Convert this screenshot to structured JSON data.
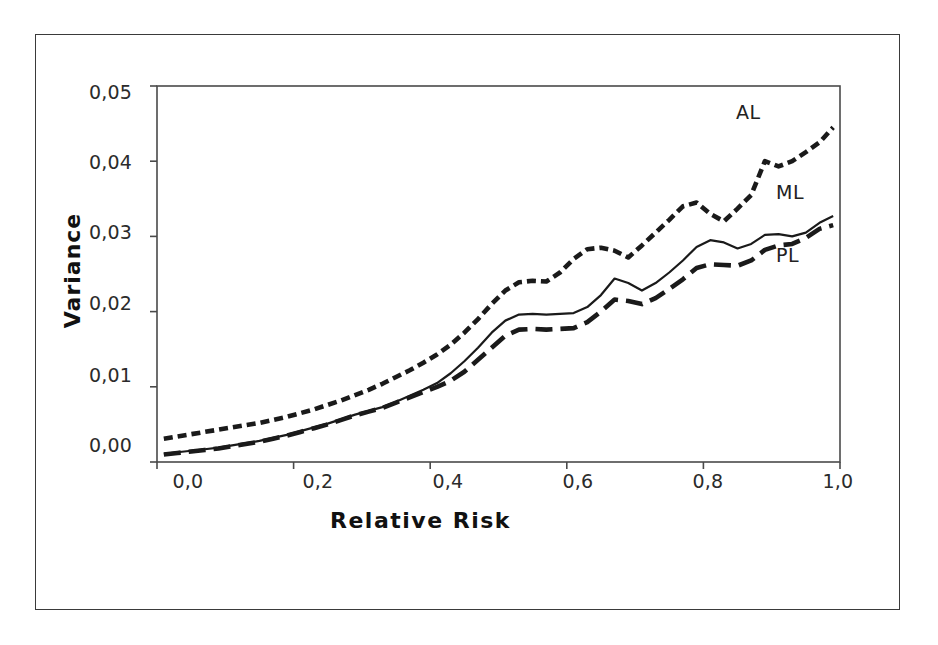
{
  "figure": {
    "background_color": "#ffffff",
    "frame_color": "#3a3a3a",
    "ink_color": "#1a1a1a"
  },
  "axis": {
    "y_title": "Variance",
    "x_title": "Relative Risk",
    "y_ticks": [
      "0,00",
      "0,01",
      "0,02",
      "0,03",
      "0,04",
      "0,05"
    ],
    "x_ticks": [
      "0,0",
      "0,2",
      "0,4",
      "0,6",
      "0,8",
      "1,0"
    ]
  },
  "series_labels": {
    "al": "AL",
    "ml": "ML",
    "pl": "PL"
  },
  "chart_data": {
    "type": "line",
    "title": "",
    "xlabel": "Relative Risk",
    "ylabel": "Variance",
    "xlim": [
      0.0,
      1.0
    ],
    "ylim": [
      0.0,
      0.05
    ],
    "xtick_values": [
      0.0,
      0.2,
      0.4,
      0.6,
      0.8,
      1.0
    ],
    "xtick_labels": [
      "0,0",
      "0,2",
      "0,4",
      "0,6",
      "0,8",
      "1,0"
    ],
    "ytick_values": [
      0.0,
      0.01,
      0.02,
      0.03,
      0.04,
      0.05
    ],
    "ytick_labels": [
      "0,00",
      "0,01",
      "0,02",
      "0,03",
      "0,04",
      "0,05"
    ],
    "grid": false,
    "legend_position": "inline-right-annotations",
    "decimal_separator": ",",
    "x": [
      0.01,
      0.03,
      0.05,
      0.07,
      0.09,
      0.11,
      0.13,
      0.15,
      0.17,
      0.19,
      0.21,
      0.23,
      0.25,
      0.27,
      0.29,
      0.31,
      0.33,
      0.35,
      0.37,
      0.39,
      0.41,
      0.43,
      0.45,
      0.47,
      0.49,
      0.51,
      0.53,
      0.55,
      0.57,
      0.59,
      0.61,
      0.63,
      0.65,
      0.67,
      0.69,
      0.71,
      0.73,
      0.75,
      0.77,
      0.79,
      0.81,
      0.83,
      0.85,
      0.87,
      0.89,
      0.91,
      0.93,
      0.95,
      0.97,
      0.99
    ],
    "series": [
      {
        "name": "AL",
        "style": "short-dashed",
        "label": "AL",
        "values": [
          0.0031,
          0.0034,
          0.0037,
          0.004,
          0.0043,
          0.0046,
          0.0049,
          0.0052,
          0.0056,
          0.006,
          0.0065,
          0.007,
          0.0076,
          0.0082,
          0.0089,
          0.0096,
          0.0104,
          0.0113,
          0.0122,
          0.0132,
          0.0143,
          0.0156,
          0.0172,
          0.019,
          0.021,
          0.0228,
          0.0239,
          0.0241,
          0.024,
          0.0252,
          0.027,
          0.0283,
          0.0285,
          0.0281,
          0.0272,
          0.0288,
          0.0305,
          0.0322,
          0.034,
          0.0345,
          0.033,
          0.032,
          0.0337,
          0.0355,
          0.04,
          0.0393,
          0.04,
          0.0412,
          0.0425,
          0.0445
        ]
      },
      {
        "name": "ML",
        "style": "solid",
        "label": "ML",
        "values": [
          0.0011,
          0.0013,
          0.0015,
          0.0017,
          0.0019,
          0.0022,
          0.0025,
          0.0028,
          0.0032,
          0.0036,
          0.0041,
          0.0046,
          0.0051,
          0.0057,
          0.0063,
          0.0068,
          0.0073,
          0.008,
          0.0088,
          0.0096,
          0.0105,
          0.0118,
          0.0134,
          0.0152,
          0.0172,
          0.0188,
          0.0196,
          0.0197,
          0.0196,
          0.0197,
          0.0198,
          0.0206,
          0.0222,
          0.0244,
          0.0238,
          0.0228,
          0.0238,
          0.0252,
          0.0268,
          0.0286,
          0.0295,
          0.0292,
          0.0284,
          0.029,
          0.0302,
          0.0303,
          0.03,
          0.0305,
          0.0318,
          0.0327
        ]
      },
      {
        "name": "PL",
        "style": "long-dashed",
        "label": "PL",
        "values": [
          0.001,
          0.0012,
          0.0014,
          0.0016,
          0.0018,
          0.0021,
          0.0024,
          0.0027,
          0.0031,
          0.0035,
          0.004,
          0.0045,
          0.005,
          0.0056,
          0.0062,
          0.0067,
          0.0072,
          0.0079,
          0.0086,
          0.0093,
          0.01,
          0.0108,
          0.012,
          0.0136,
          0.0152,
          0.0168,
          0.0176,
          0.0177,
          0.0176,
          0.0177,
          0.0178,
          0.0186,
          0.02,
          0.0216,
          0.0214,
          0.021,
          0.0218,
          0.023,
          0.0243,
          0.0258,
          0.0263,
          0.0262,
          0.0261,
          0.0268,
          0.0282,
          0.0288,
          0.029,
          0.0298,
          0.031,
          0.0315
        ]
      }
    ]
  }
}
